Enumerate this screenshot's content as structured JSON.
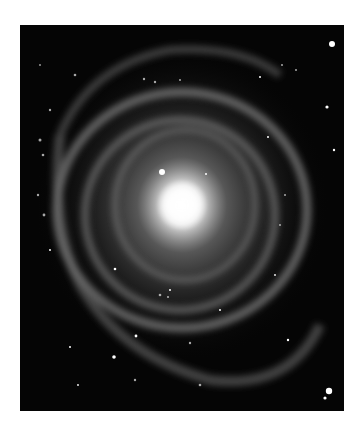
{
  "image": {
    "subject": "spiral galaxy",
    "description": "Grayscale photograph of a ringed spiral galaxy with a bright core, multiple concentric spiral arms and foreground stars",
    "colors": {
      "background": "#ffffff",
      "sky": "#050505",
      "core": "#ffffff",
      "arms": "#8a8a8a"
    }
  }
}
